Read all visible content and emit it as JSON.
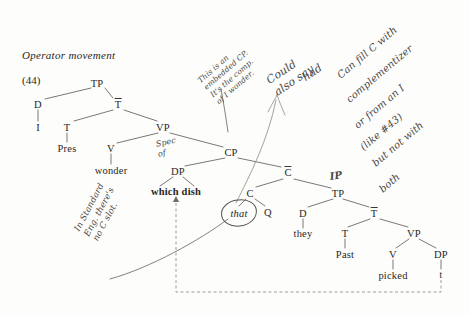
{
  "title": "Operator movement",
  "example_number": "(44)",
  "tree": {
    "nodes": [
      {
        "id": "tp1",
        "label": "TP",
        "x": 97,
        "y": 83,
        "style": "plain"
      },
      {
        "id": "d1",
        "label": "D",
        "x": 38,
        "y": 104,
        "style": "plain"
      },
      {
        "id": "i1",
        "label": "I",
        "x": 38,
        "y": 127,
        "style": "plain"
      },
      {
        "id": "tbar1",
        "label": "T",
        "x": 118,
        "y": 104,
        "style": "bar"
      },
      {
        "id": "t1",
        "label": "T",
        "x": 67,
        "y": 127,
        "style": "plain"
      },
      {
        "id": "pres",
        "label": "Pres",
        "x": 67,
        "y": 148,
        "style": "plain"
      },
      {
        "id": "vp1",
        "label": "VP",
        "x": 163,
        "y": 127,
        "style": "plain"
      },
      {
        "id": "v1",
        "label": "V",
        "x": 111,
        "y": 148,
        "style": "plain"
      },
      {
        "id": "wonder",
        "label": "wonder",
        "x": 111,
        "y": 170,
        "style": "plain"
      },
      {
        "id": "cp",
        "label": "CP",
        "x": 231,
        "y": 152,
        "style": "plain"
      },
      {
        "id": "dp1",
        "label": "DP",
        "x": 178,
        "y": 171,
        "style": "plain"
      },
      {
        "id": "whichdish",
        "label": "which dish",
        "x": 176,
        "y": 191,
        "style": "bold"
      },
      {
        "id": "cbar",
        "label": "C",
        "x": 288,
        "y": 172,
        "style": "bar"
      },
      {
        "id": "c1",
        "label": "C",
        "x": 250,
        "y": 193,
        "style": "plain"
      },
      {
        "id": "that",
        "label": "that",
        "x": 239,
        "y": 213,
        "style": "ital"
      },
      {
        "id": "q",
        "label": "Q",
        "x": 268,
        "y": 212,
        "style": "plain"
      },
      {
        "id": "tp2",
        "label": "TP",
        "x": 338,
        "y": 193,
        "style": "plain"
      },
      {
        "id": "d2",
        "label": "D",
        "x": 303,
        "y": 213,
        "style": "plain"
      },
      {
        "id": "they",
        "label": "they",
        "x": 303,
        "y": 233,
        "style": "plain"
      },
      {
        "id": "tbar2",
        "label": "T",
        "x": 374,
        "y": 213,
        "style": "bar"
      },
      {
        "id": "t2",
        "label": "T",
        "x": 345,
        "y": 233,
        "style": "plain"
      },
      {
        "id": "past",
        "label": "Past",
        "x": 345,
        "y": 254,
        "style": "plain"
      },
      {
        "id": "vp2",
        "label": "VP",
        "x": 414,
        "y": 233,
        "style": "plain"
      },
      {
        "id": "v2",
        "label": "V",
        "x": 393,
        "y": 254,
        "style": "plain"
      },
      {
        "id": "picked",
        "label": "picked",
        "x": 393,
        "y": 275,
        "style": "plain"
      },
      {
        "id": "dp2",
        "label": "DP",
        "x": 441,
        "y": 254,
        "style": "plain"
      },
      {
        "id": "trace",
        "label": "t",
        "x": 441,
        "y": 275,
        "style": "small"
      }
    ]
  },
  "annotations": {
    "spec_of": "Spec\nof",
    "ip_gloss": "IP",
    "note_embedded_cp": "This is an\nembedded CP.\nIt's the comp.\nof I wonder.",
    "note_could_also_say": "Could\nalso say",
    "note_had": "had",
    "note_fill_c_line1": "Can fill C with",
    "note_fill_c_line2": "complementizer",
    "note_fill_c_line3": "or from an I",
    "note_fill_c_line4": "(like #43)",
    "note_fill_c_line5": "but not with",
    "note_fill_c_line6": "both",
    "note_standard_eng": "In Standard\nEng. there's\nno C slot."
  },
  "colors": {
    "ink": "#2a2724",
    "pencil": "#4a4744",
    "paper": "#fdfdfb"
  }
}
